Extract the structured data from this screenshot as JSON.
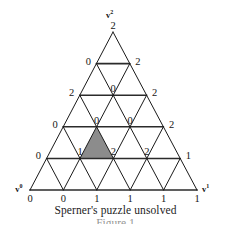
{
  "figure": {
    "caption": "Sperner's puzzle unsolved",
    "caption_cut": "Figure 1",
    "corner_labels": {
      "left": {
        "base": "v",
        "sup": "0"
      },
      "right": {
        "base": "v",
        "sup": "1"
      },
      "apex": {
        "base": "v",
        "sup": "2"
      }
    },
    "colors": {
      "line": "#1a1a1a",
      "horizontal_line": "#2b2b2b",
      "shaded_cell": "#8c8c8c",
      "background": "#ffffff",
      "text": "#151515"
    },
    "geometry": {
      "apex_x": 113,
      "apex_y": 32,
      "left_x": 30,
      "left_y": 190,
      "right_x": 197,
      "right_y": 190,
      "subdivisions": 5
    },
    "shaded_triangle": {
      "row": 4,
      "cell": 1,
      "orientation": "up",
      "vertex_values": [
        0,
        1,
        2
      ]
    },
    "rows": [
      {
        "index": 0,
        "labels": [
          "2"
        ]
      },
      {
        "index": 1,
        "labels": [
          "0",
          "2"
        ]
      },
      {
        "index": 2,
        "labels": [
          "2",
          "0",
          "2"
        ]
      },
      {
        "index": 3,
        "labels": [
          "0",
          "0",
          "0",
          "2"
        ]
      },
      {
        "index": 4,
        "labels": [
          "0",
          "1",
          "2",
          "2",
          "1"
        ]
      },
      {
        "index": 5,
        "labels": [
          "0",
          "0",
          "1",
          "1",
          "1",
          "1"
        ]
      }
    ]
  }
}
